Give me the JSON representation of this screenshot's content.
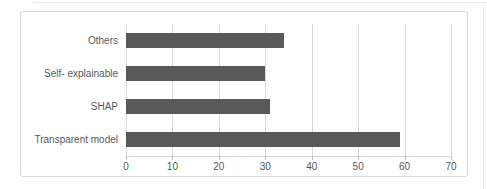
{
  "chart_data": {
    "type": "bar",
    "orientation": "horizontal",
    "title": "",
    "xlabel": "",
    "ylabel": "",
    "categories": [
      "Others",
      "Self- explainable",
      "SHAP",
      "Transparent model"
    ],
    "values": [
      34,
      30,
      31,
      59
    ],
    "xlim": [
      0,
      70
    ],
    "xticks": [
      0,
      10,
      20,
      30,
      40,
      50,
      60,
      70
    ],
    "grid": true,
    "legend": false,
    "colors": {
      "bar": "#595959",
      "gridline": "#d9d9d9",
      "tick_mark": "#bfbfbf",
      "axis_text": "#595959",
      "panel_border": "#d9d9d9",
      "background": "#ffffff"
    }
  }
}
